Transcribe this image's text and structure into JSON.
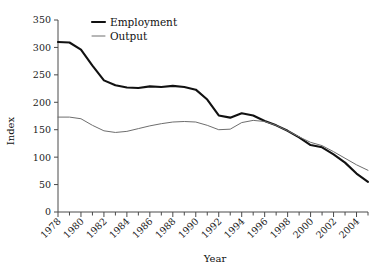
{
  "chart_data": {
    "type": "line",
    "title": "",
    "xlabel": "Year",
    "ylabel": "Index",
    "xlim": [
      1978,
      2005
    ],
    "ylim": [
      0,
      350
    ],
    "grid": false,
    "legend_position": "top-left-inside",
    "y_ticks": [
      0,
      50,
      100,
      150,
      200,
      250,
      300,
      350
    ],
    "y_tick_labels": [
      "0",
      "50",
      "100",
      "150",
      "200",
      "250",
      "300",
      "350"
    ],
    "x_ticks": [
      1978,
      1979,
      1980,
      1981,
      1982,
      1983,
      1984,
      1985,
      1986,
      1987,
      1988,
      1989,
      1990,
      1991,
      1992,
      1993,
      1994,
      1995,
      1996,
      1997,
      1998,
      1999,
      2000,
      2001,
      2002,
      2003,
      2004,
      2005
    ],
    "x_tick_labels": [
      "1978",
      "1980",
      "1982",
      "1984",
      "1986",
      "1988",
      "1990",
      "1992",
      "1994",
      "1996",
      "1998",
      "2000",
      "2002",
      "2004"
    ],
    "x_labeled_years": [
      1978,
      1980,
      1982,
      1984,
      1986,
      1988,
      1990,
      1992,
      1994,
      1996,
      1998,
      2000,
      2002,
      2004
    ],
    "x": [
      1978,
      1979,
      1980,
      1981,
      1982,
      1983,
      1984,
      1985,
      1986,
      1987,
      1988,
      1989,
      1990,
      1991,
      1992,
      1993,
      1994,
      1995,
      1996,
      1997,
      1998,
      1999,
      2000,
      2001,
      2002,
      2003,
      2004,
      2005
    ],
    "series": [
      {
        "name": "Employment",
        "color": "#111111",
        "width": 2.1,
        "values": [
          310,
          309,
          296,
          267,
          240,
          231,
          227,
          226,
          229,
          228,
          230,
          228,
          223,
          205,
          176,
          172,
          180,
          176,
          166,
          158,
          148,
          136,
          122,
          118,
          105,
          90,
          70,
          55
        ]
      },
      {
        "name": "Output",
        "color": "#6e6e6e",
        "width": 1.0,
        "values": [
          173,
          173,
          170,
          158,
          148,
          145,
          147,
          152,
          157,
          161,
          164,
          165,
          164,
          158,
          150,
          151,
          163,
          167,
          165,
          158,
          148,
          137,
          127,
          121,
          110,
          98,
          86,
          76
        ]
      }
    ]
  },
  "legend": {
    "items": [
      {
        "label": "Employment",
        "color": "#111111"
      },
      {
        "label": "Output",
        "color": "#6e6e6e"
      }
    ]
  },
  "axes": {
    "y_title": "Index",
    "x_title": "Year"
  }
}
